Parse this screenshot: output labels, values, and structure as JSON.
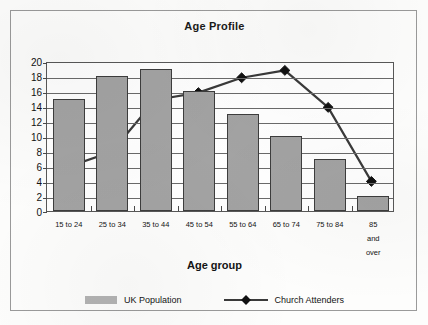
{
  "chart_data": {
    "type": "bar",
    "title": "Age Profile",
    "xlabel": "Age group",
    "ylabel": "",
    "ylim": [
      0,
      20
    ],
    "ytick_step": 2,
    "yticks": [
      0,
      2,
      4,
      6,
      8,
      10,
      12,
      14,
      16,
      18,
      20
    ],
    "grid": true,
    "legend_position": "bottom",
    "categories": [
      "15 to 24",
      "25 to 34",
      "35 to 44",
      "45 to 54",
      "55 to 64",
      "65 to 74",
      "75 to 84",
      "85 and\nover"
    ],
    "series": [
      {
        "name": "UK Population",
        "type": "bar",
        "color": "#a3a3a3",
        "values": [
          15,
          18,
          19,
          16,
          13,
          10,
          7,
          2
        ]
      },
      {
        "name": "Church Attenders",
        "type": "line",
        "color": "#3a3a3a",
        "marker": "diamond",
        "marker_color": "#111111",
        "values": [
          6,
          8,
          15,
          16,
          18,
          19,
          14,
          4
        ]
      }
    ]
  },
  "legend": {
    "entries": [
      {
        "label": "UK Population",
        "swatch": "bar-swatch"
      },
      {
        "label": "Church Attenders",
        "swatch": "line-diamond-swatch"
      }
    ]
  },
  "colors": {
    "bar_fill": "#a3a3a3",
    "bar_outline": "#3d3d3d",
    "line": "#3a3a3a",
    "marker": "#111111",
    "plot_border": "#585858",
    "gridline": "#6a6a6a",
    "frame": "#9a9a9a",
    "background": "#fdfdfc"
  }
}
